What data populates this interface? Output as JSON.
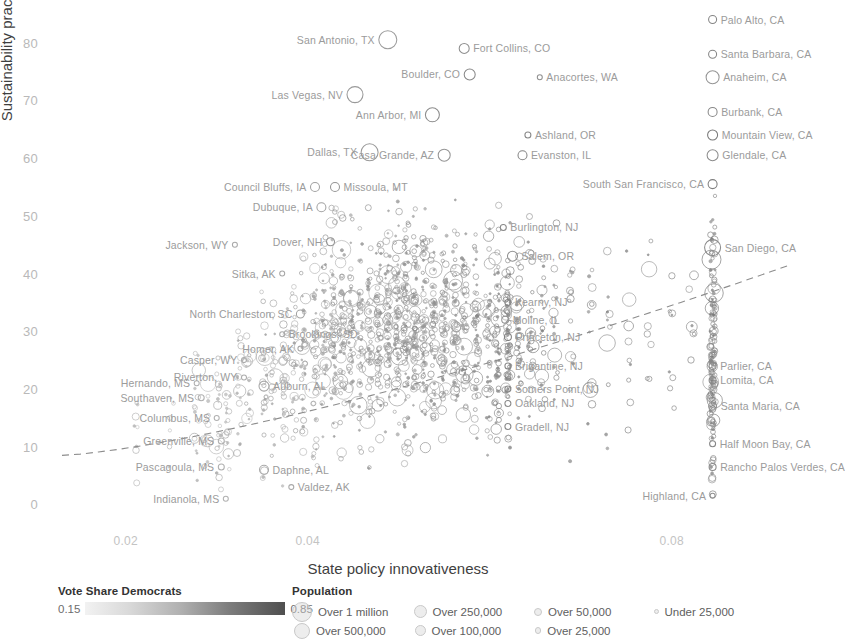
{
  "chart_data": {
    "type": "scatter",
    "title": "",
    "xlabel": "State policy innovativeness",
    "ylabel": "Sustainability practices",
    "xticks": [
      0.02,
      0.04,
      0.08
    ],
    "xtick_labels": [
      "0.02",
      "0.04",
      "0.08"
    ],
    "yticks": [
      0,
      10,
      20,
      30,
      40,
      50,
      60,
      70,
      80
    ],
    "ytick_labels": [
      "0",
      "10",
      "20",
      "30",
      "40",
      "50",
      "60",
      "70",
      "80"
    ],
    "xlim": [
      0.013,
      0.093
    ],
    "ylim": [
      -2,
      86
    ],
    "grid": false,
    "marker": "open-circle",
    "size_encodes": "Population",
    "color_encodes": "Vote Share Democrats",
    "trendline": {
      "style": "dashed",
      "x0": 0.013,
      "y0": 8.5,
      "x1": 0.093,
      "y1": 41.5
    },
    "labeled_points": [
      {
        "label": "Palo Alto, CA",
        "x": 0.0845,
        "y": 84.0,
        "r": 4.0,
        "shade": 0.62,
        "side": "left"
      },
      {
        "label": "Santa Barbara, CA",
        "x": 0.0845,
        "y": 78.0,
        "r": 4.0,
        "shade": 0.62,
        "side": "left"
      },
      {
        "label": "Anaheim, CA",
        "x": 0.0845,
        "y": 74.0,
        "r": 6.5,
        "shade": 0.52,
        "side": "left"
      },
      {
        "label": "San Antonio, TX",
        "x": 0.0488,
        "y": 80.5,
        "r": 9.0,
        "shade": 0.48,
        "side": "right"
      },
      {
        "label": "Fort Collins, CO",
        "x": 0.0572,
        "y": 79.0,
        "r": 5.0,
        "shade": 0.56,
        "side": "left"
      },
      {
        "label": "Boulder, CO",
        "x": 0.0578,
        "y": 74.5,
        "r": 5.5,
        "shade": 0.6,
        "side": "right"
      },
      {
        "label": "Anacortes, WA",
        "x": 0.0655,
        "y": 74.0,
        "r": 2.5,
        "shade": 0.55,
        "side": "left"
      },
      {
        "label": "Las Vegas, NV",
        "x": 0.0452,
        "y": 71.0,
        "r": 8.0,
        "shade": 0.5,
        "side": "right"
      },
      {
        "label": "Burbank, CA",
        "x": 0.0845,
        "y": 68.0,
        "r": 4.5,
        "shade": 0.6,
        "side": "left"
      },
      {
        "label": "Ann Arbor, MI",
        "x": 0.0537,
        "y": 67.5,
        "r": 7.0,
        "shade": 0.58,
        "side": "right"
      },
      {
        "label": "Mountain View, CA",
        "x": 0.0845,
        "y": 64.0,
        "r": 5.0,
        "shade": 0.7,
        "side": "left"
      },
      {
        "label": "Ashland, OR",
        "x": 0.0642,
        "y": 64.0,
        "r": 3.0,
        "shade": 0.6,
        "side": "left"
      },
      {
        "label": "Glendale, CA",
        "x": 0.0845,
        "y": 60.5,
        "r": 5.5,
        "shade": 0.58,
        "side": "left"
      },
      {
        "label": "Dallas, TX",
        "x": 0.0468,
        "y": 61.0,
        "r": 8.5,
        "shade": 0.5,
        "side": "right"
      },
      {
        "label": "Casa Grande, AZ",
        "x": 0.055,
        "y": 60.5,
        "r": 6.0,
        "shade": 0.52,
        "side": "right"
      },
      {
        "label": "Evanston, IL",
        "x": 0.0636,
        "y": 60.5,
        "r": 4.5,
        "shade": 0.62,
        "side": "left"
      },
      {
        "label": "South San Francisco, CA",
        "x": 0.0845,
        "y": 55.5,
        "r": 4.5,
        "shade": 0.66,
        "side": "right"
      },
      {
        "label": "Council Bluffs, IA",
        "x": 0.0408,
        "y": 55.0,
        "r": 4.5,
        "shade": 0.45,
        "side": "right"
      },
      {
        "label": "Missoula, MT",
        "x": 0.043,
        "y": 55.0,
        "r": 4.5,
        "shade": 0.52,
        "side": "left"
      },
      {
        "label": "Dubuque, IA",
        "x": 0.0415,
        "y": 51.5,
        "r": 4.5,
        "shade": 0.45,
        "side": "right"
      },
      {
        "label": "Burlington, NJ",
        "x": 0.0615,
        "y": 48.0,
        "r": 3.0,
        "shade": 0.6,
        "side": "left"
      },
      {
        "label": "Dover, NH",
        "x": 0.0425,
        "y": 45.5,
        "r": 4.0,
        "shade": 0.55,
        "side": "right"
      },
      {
        "label": "San Diego, CA",
        "x": 0.0845,
        "y": 44.5,
        "r": 8.0,
        "shade": 0.58,
        "side": "left"
      },
      {
        "label": "Jackson, WY",
        "x": 0.032,
        "y": 45.0,
        "r": 2.5,
        "shade": 0.4,
        "side": "right"
      },
      {
        "label": "Salem, OR",
        "x": 0.0625,
        "y": 43.0,
        "r": 5.0,
        "shade": 0.55,
        "side": "left"
      },
      {
        "label": "Sitka, AK",
        "x": 0.0372,
        "y": 40.0,
        "r": 2.5,
        "shade": 0.42,
        "side": "right"
      },
      {
        "label": "Kearny, NJ",
        "x": 0.062,
        "y": 35.0,
        "r": 3.0,
        "shade": 0.62,
        "side": "left"
      },
      {
        "label": "Moline, IL",
        "x": 0.0617,
        "y": 32.0,
        "r": 3.5,
        "shade": 0.52,
        "side": "left"
      },
      {
        "label": "North Charleston, SC",
        "x": 0.0392,
        "y": 33.0,
        "r": 4.0,
        "shade": 0.44,
        "side": "right"
      },
      {
        "label": "Brookings, SD",
        "x": 0.0372,
        "y": 29.5,
        "r": 2.5,
        "shade": 0.4,
        "side": "left"
      },
      {
        "label": "Princeton, NJ",
        "x": 0.062,
        "y": 29.0,
        "r": 3.5,
        "shade": 0.64,
        "side": "left"
      },
      {
        "label": "Homer, AK",
        "x": 0.0392,
        "y": 27.0,
        "r": 2.5,
        "shade": 0.42,
        "side": "right"
      },
      {
        "label": "Casper, WY",
        "x": 0.033,
        "y": 25.0,
        "r": 2.5,
        "shade": 0.38,
        "side": "right"
      },
      {
        "label": "Brigantine, NJ",
        "x": 0.062,
        "y": 24.0,
        "r": 3.0,
        "shade": 0.6,
        "side": "left"
      },
      {
        "label": "Parlier, CA",
        "x": 0.0845,
        "y": 24.0,
        "r": 3.5,
        "shade": 0.6,
        "side": "left"
      },
      {
        "label": "Riverton, WY",
        "x": 0.033,
        "y": 22.0,
        "r": 2.5,
        "shade": 0.38,
        "side": "right"
      },
      {
        "label": "Lomita, CA",
        "x": 0.0845,
        "y": 21.5,
        "r": 3.5,
        "shade": 0.6,
        "side": "left"
      },
      {
        "label": "Hernando, MS",
        "x": 0.0278,
        "y": 21.0,
        "r": 2.5,
        "shade": 0.36,
        "side": "right"
      },
      {
        "label": "Auburn, AL",
        "x": 0.0352,
        "y": 20.5,
        "r": 5.0,
        "shade": 0.42,
        "side": "left"
      },
      {
        "label": "Somers Point, NJ",
        "x": 0.062,
        "y": 20.0,
        "r": 3.0,
        "shade": 0.6,
        "side": "left"
      },
      {
        "label": "Southaven, MS",
        "x": 0.0283,
        "y": 18.5,
        "r": 3.0,
        "shade": 0.36,
        "side": "right"
      },
      {
        "label": "Oakland, NJ",
        "x": 0.062,
        "y": 17.5,
        "r": 3.0,
        "shade": 0.58,
        "side": "left"
      },
      {
        "label": "Santa Maria, CA",
        "x": 0.0845,
        "y": 17.0,
        "r": 4.0,
        "shade": 0.55,
        "side": "left"
      },
      {
        "label": "Columbus, MS",
        "x": 0.03,
        "y": 15.0,
        "r": 2.5,
        "shade": 0.36,
        "side": "right"
      },
      {
        "label": "Gradell, NJ",
        "x": 0.062,
        "y": 13.5,
        "r": 3.0,
        "shade": 0.6,
        "side": "left"
      },
      {
        "label": "Greenville, MS",
        "x": 0.0305,
        "y": 11.0,
        "r": 3.0,
        "shade": 0.36,
        "side": "right"
      },
      {
        "label": "Half Moon Bay, CA",
        "x": 0.0845,
        "y": 10.5,
        "r": 3.0,
        "shade": 0.62,
        "side": "left"
      },
      {
        "label": "Rancho Palos Verdes, CA",
        "x": 0.0845,
        "y": 6.5,
        "r": 3.5,
        "shade": 0.6,
        "side": "left"
      },
      {
        "label": "Pascagoula, MS",
        "x": 0.0305,
        "y": 6.5,
        "r": 3.0,
        "shade": 0.36,
        "side": "right"
      },
      {
        "label": "Daphne, AL",
        "x": 0.0352,
        "y": 6.0,
        "r": 4.5,
        "shade": 0.4,
        "side": "left"
      },
      {
        "label": "Valdez, AK",
        "x": 0.0382,
        "y": 3.0,
        "r": 2.5,
        "shade": 0.4,
        "side": "left"
      },
      {
        "label": "Indianola, MS",
        "x": 0.031,
        "y": 1.0,
        "r": 2.5,
        "shade": 0.35,
        "side": "right"
      },
      {
        "label": "Highland, CA",
        "x": 0.0845,
        "y": 1.5,
        "r": 2.5,
        "shade": 0.55,
        "side": "right"
      }
    ]
  },
  "axes": {
    "ylabel": "Sustainability practices",
    "xlabel": "State policy innovativeness"
  },
  "colorbar": {
    "title": "Vote Share Democrats",
    "min": "0.15",
    "max": "0.85"
  },
  "population_legend": {
    "title": "Population",
    "items": [
      {
        "label": "Over 1 million",
        "r": 9.0
      },
      {
        "label": "Over 500,000",
        "r": 7.0
      },
      {
        "label": "Over 250,000",
        "r": 5.5
      },
      {
        "label": "Over 100,000",
        "r": 4.5
      },
      {
        "label": "Over 50,000",
        "r": 3.0
      },
      {
        "label": "Over 25,000",
        "r": 2.2
      },
      {
        "label": "Under 25,000",
        "r": 1.4
      }
    ]
  }
}
